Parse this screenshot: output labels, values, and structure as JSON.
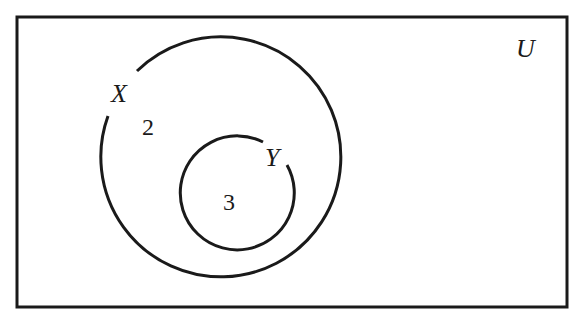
{
  "diagram": {
    "type": "venn",
    "universal_set": {
      "label": "U"
    },
    "sets": [
      {
        "label": "X",
        "region_value": "2"
      },
      {
        "label": "Y",
        "region_value": "3",
        "subset_of": "X"
      }
    ]
  }
}
